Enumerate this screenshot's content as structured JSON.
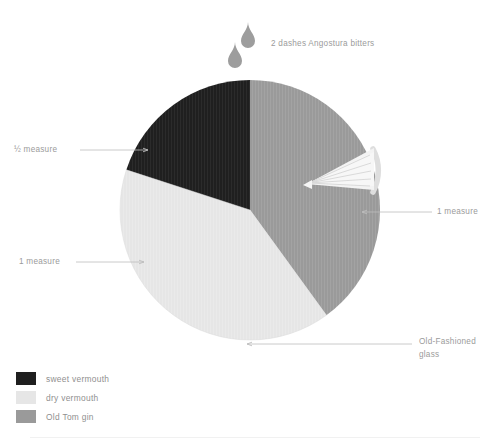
{
  "chart_data": {
    "type": "pie",
    "title": "",
    "subtitle": "",
    "xlabel": "",
    "ylabel": "",
    "grid": false,
    "legend_position": "bottom-left",
    "center": {
      "x": 250,
      "y": 210
    },
    "radius": 130,
    "total_measures": 2.5,
    "categories": [
      "sweet vermouth",
      "dry vermouth",
      "Old Tom gin"
    ],
    "values": [
      0.5,
      1,
      1
    ],
    "value_labels": [
      "½ measure",
      "1 measure",
      "1 measure"
    ],
    "percentages": [
      20,
      40,
      40
    ],
    "colors": [
      "#1f1f1f",
      "#e6e6e6",
      "#9a9a9a"
    ],
    "slices": [
      {
        "name": "sweet vermouth",
        "value": 0.5,
        "value_label": "½ measure",
        "percent": 20,
        "color": "#1f1f1f",
        "start_angle_deg": 288,
        "end_angle_deg": 360
      },
      {
        "name": "dry vermouth",
        "value": 1,
        "value_label": "1 measure",
        "percent": 40,
        "color": "#e6e6e6",
        "start_angle_deg": 144,
        "end_angle_deg": 288
      },
      {
        "name": "Old Tom gin",
        "value": 1,
        "value_label": "1 measure",
        "percent": 40,
        "color": "#9a9a9a",
        "start_angle_deg": 0,
        "end_angle_deg": 144
      }
    ],
    "annotations": [
      {
        "text": "2 dashes Angostura bitters",
        "position": "top"
      },
      {
        "text": "½ measure",
        "position": "left-upper"
      },
      {
        "text": "1 measure",
        "position": "left-lower"
      },
      {
        "text": "1 measure",
        "position": "right"
      },
      {
        "text": "Old-Fashioned glass",
        "position": "bottom-right"
      }
    ]
  },
  "annotations": {
    "bitters": "2 dashes Angostura bitters",
    "half_measure": "½ measure",
    "one_measure_left": "1 measure",
    "one_measure_right": "1 measure",
    "glass_line_1": "Old-Fashioned",
    "glass_line_2": "glass"
  },
  "legend": {
    "items": [
      {
        "label": "sweet vermouth",
        "color": "#1f1f1f"
      },
      {
        "label": "dry vermouth",
        "color": "#e6e6e6"
      },
      {
        "label": "Old Tom gin",
        "color": "#9a9a9a"
      }
    ]
  },
  "garnish": {
    "citrus_twist": "citrus-twist-icon",
    "droplets": [
      "droplet-icon",
      "droplet-icon"
    ]
  },
  "palette": {
    "dark": "#1f1f1f",
    "light": "#e6e6e6",
    "mid": "#9a9a9a",
    "text": "#9b9b9b",
    "leader": "#bdbdbd",
    "background": "#ffffff"
  }
}
